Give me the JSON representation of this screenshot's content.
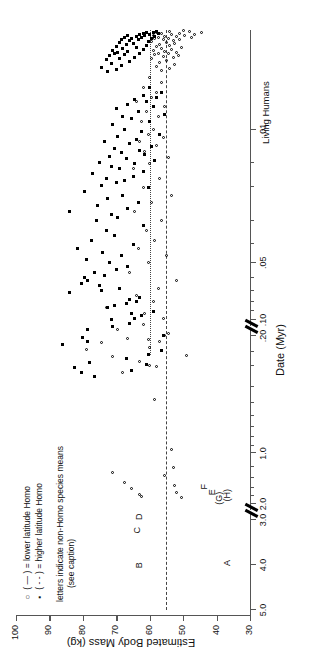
{
  "figure": {
    "x_axis_title": "Date (Myr)",
    "y_axis_title": "Estimated Body Mass (kg)",
    "living_humans_label": "Living Humans"
  },
  "legend": {
    "row1_symbol": "○",
    "row1_dash": "( — )",
    "row1_text": "= lower latitude Homo",
    "row2_symbol": "▪",
    "row2_dash": "( - - )",
    "row2_text": "= higher latitude Homo",
    "note_line1": "letters indicate non-Homo species means",
    "note_line2": "(see caption)"
  },
  "species_letters": [
    {
      "label": "A",
      "date": 4.0,
      "mass": 36.5
    },
    {
      "label": "B",
      "date": 4.05,
      "mass": 63.0
    },
    {
      "label": "C",
      "date": 2.95,
      "mass": 63.5
    },
    {
      "label": "D",
      "date": 2.45,
      "mass": 63.0
    },
    {
      "label": "E",
      "date": 1.75,
      "mass": 41.0
    },
    {
      "label": "F",
      "date": 1.62,
      "mass": 43.5
    },
    {
      "label": "(G)",
      "date": 1.9,
      "mass": 39.0
    },
    {
      "label": "(H)",
      "date": 1.82,
      "mass": 36.5
    }
  ],
  "mean_lines": [
    {
      "name": "lower-latitude-Homo-mean",
      "style": "dashed",
      "mass": 55.0,
      "span": "full"
    },
    {
      "name": "higher-latitude-Homo-mean",
      "style": "dotted",
      "mass": 60.0,
      "span": "recent"
    }
  ],
  "chart_data": {
    "type": "scatter",
    "title": "",
    "xlabel": "Date (Myr)",
    "ylabel": "Estimated Body Mass (kg)",
    "grid": false,
    "legend_position": "upper-left",
    "x_scale": "broken-reversed-log",
    "x_tick_labels": [
      "5.0",
      "4.0",
      "3.0",
      "2.0",
      "1.0",
      ".20",
      ".10",
      ".05",
      ".01",
      "Living Humans"
    ],
    "x_tick_values": [
      5.0,
      4.0,
      3.0,
      2.0,
      1.0,
      0.2,
      0.1,
      0.05,
      0.01,
      0.0
    ],
    "x_axis_breaks": [
      [
        3.0,
        2.0
      ],
      [
        0.2,
        0.1
      ]
    ],
    "y_tick_labels": [
      "30",
      "40",
      "50",
      "60",
      "70",
      "80",
      "90",
      "100"
    ],
    "y_tick_values": [
      30,
      40,
      50,
      60,
      70,
      80,
      90,
      100
    ],
    "ylim": [
      30,
      100
    ],
    "annotations": [
      {
        "text": "A",
        "x": 4.0,
        "y": 36.5
      },
      {
        "text": "B",
        "x": 4.05,
        "y": 63.0
      },
      {
        "text": "C",
        "x": 2.95,
        "y": 63.5
      },
      {
        "text": "D",
        "x": 2.45,
        "y": 63.0
      },
      {
        "text": "E",
        "x": 1.75,
        "y": 41.0
      },
      {
        "text": "F",
        "x": 1.62,
        "y": 43.5
      },
      {
        "text": "(G)",
        "x": 1.9,
        "y": 39.0
      },
      {
        "text": "(H)",
        "x": 1.82,
        "y": 36.5
      }
    ],
    "reference_lines": [
      {
        "label": "lower latitude Homo mean",
        "y": 55.0,
        "style": "dashed"
      },
      {
        "label": "higher latitude Homo mean",
        "y": 60.0,
        "style": "dotted"
      }
    ],
    "series": [
      {
        "name": "lower latitude Homo",
        "marker": "open-circle",
        "points": [
          [
            1.82,
            50.5
          ],
          [
            1.8,
            62.5
          ],
          [
            1.75,
            63.0
          ],
          [
            1.7,
            52.0
          ],
          [
            1.62,
            65.5
          ],
          [
            1.55,
            52.5
          ],
          [
            1.48,
            67.5
          ],
          [
            1.35,
            55.5
          ],
          [
            1.3,
            71.0
          ],
          [
            1.22,
            53.0
          ],
          [
            0.95,
            53.5
          ],
          [
            0.48,
            58.5
          ],
          [
            0.3,
            60.0
          ],
          [
            0.26,
            49.0
          ],
          [
            0.24,
            79.0
          ],
          [
            0.22,
            74.5
          ],
          [
            0.21,
            60.5
          ],
          [
            0.2,
            55.5
          ],
          [
            0.19,
            68.0
          ],
          [
            0.175,
            58.0
          ],
          [
            0.165,
            63.0
          ],
          [
            0.155,
            71.0
          ],
          [
            0.14,
            60.0
          ],
          [
            0.13,
            57.0
          ],
          [
            0.125,
            66.5
          ],
          [
            0.118,
            54.5
          ],
          [
            0.112,
            69.5
          ],
          [
            0.105,
            62.0
          ],
          [
            0.098,
            56.0
          ],
          [
            0.092,
            61.5
          ],
          [
            0.086,
            73.0
          ],
          [
            0.08,
            59.0
          ],
          [
            0.074,
            64.0
          ],
          [
            0.068,
            57.5
          ],
          [
            0.062,
            52.0
          ],
          [
            0.056,
            66.0
          ],
          [
            0.05,
            60.5
          ],
          [
            0.046,
            55.0
          ],
          [
            0.042,
            63.5
          ],
          [
            0.038,
            58.5
          ],
          [
            0.034,
            61.0
          ],
          [
            0.03,
            56.5
          ],
          [
            0.027,
            64.5
          ],
          [
            0.024,
            59.5
          ],
          [
            0.022,
            53.5
          ],
          [
            0.02,
            62.0
          ],
          [
            0.018,
            57.0
          ],
          [
            0.016,
            65.0
          ],
          [
            0.015,
            60.0
          ],
          [
            0.014,
            54.5
          ],
          [
            0.013,
            61.5
          ],
          [
            0.012,
            58.0
          ],
          [
            0.0115,
            63.0
          ],
          [
            0.011,
            56.0
          ],
          [
            0.0105,
            60.5
          ],
          [
            0.01,
            59.0
          ],
          [
            0.0095,
            62.5
          ],
          [
            0.009,
            57.5
          ],
          [
            0.0085,
            61.0
          ],
          [
            0.008,
            55.5
          ],
          [
            0.0075,
            64.0
          ],
          [
            0.007,
            59.5
          ],
          [
            0.0065,
            58.0
          ],
          [
            0.006,
            62.0
          ],
          [
            0.0055,
            56.5
          ],
          [
            0.005,
            60.0
          ]
        ]
      },
      {
        "name": "higher latitude Homo",
        "marker": "filled-square",
        "points": [
          [
            0.225,
            86.0
          ],
          [
            0.215,
            78.5
          ],
          [
            0.205,
            80.0
          ],
          [
            0.198,
            76.5
          ],
          [
            0.19,
            80.5
          ],
          [
            0.185,
            65.5
          ],
          [
            0.178,
            82.5
          ],
          [
            0.172,
            61.0
          ],
          [
            0.168,
            78.0
          ],
          [
            0.16,
            67.0
          ],
          [
            0.152,
            60.5
          ],
          [
            0.145,
            56.5
          ],
          [
            0.12,
            56.0
          ],
          [
            0.112,
            78.5
          ],
          [
            0.108,
            71.0
          ],
          [
            0.104,
            66.0
          ],
          [
            0.1,
            71.5
          ],
          [
            0.098,
            64.5
          ],
          [
            0.095,
            62.5
          ],
          [
            0.092,
            65.5
          ],
          [
            0.09,
            59.0
          ],
          [
            0.086,
            72.5
          ],
          [
            0.084,
            70.5
          ],
          [
            0.082,
            67.0
          ],
          [
            0.08,
            64.0
          ],
          [
            0.078,
            66.0
          ],
          [
            0.076,
            63.0
          ],
          [
            0.072,
            84.0
          ],
          [
            0.07,
            74.5
          ],
          [
            0.068,
            69.0
          ],
          [
            0.066,
            75.0
          ],
          [
            0.064,
            80.5
          ],
          [
            0.062,
            78.5
          ],
          [
            0.06,
            79.5
          ],
          [
            0.058,
            73.5
          ],
          [
            0.056,
            76.5
          ],
          [
            0.054,
            70.0
          ],
          [
            0.052,
            66.5
          ],
          [
            0.05,
            72.0
          ],
          [
            0.048,
            79.0
          ],
          [
            0.046,
            68.5
          ],
          [
            0.044,
            74.0
          ],
          [
            0.042,
            81.5
          ],
          [
            0.04,
            65.0
          ],
          [
            0.038,
            77.5
          ],
          [
            0.036,
            70.5
          ],
          [
            0.034,
            73.0
          ],
          [
            0.032,
            62.0
          ],
          [
            0.03,
            76.0
          ],
          [
            0.029,
            69.5
          ],
          [
            0.028,
            71.5
          ],
          [
            0.027,
            84.0
          ],
          [
            0.026,
            66.5
          ],
          [
            0.025,
            75.5
          ],
          [
            0.024,
            63.5
          ],
          [
            0.023,
            72.5
          ],
          [
            0.022,
            68.0
          ],
          [
            0.021,
            79.5
          ],
          [
            0.02,
            60.5
          ],
          [
            0.0195,
            74.5
          ],
          [
            0.019,
            70.0
          ],
          [
            0.0185,
            67.5
          ],
          [
            0.018,
            73.0
          ],
          [
            0.0175,
            65.0
          ],
          [
            0.017,
            77.0
          ],
          [
            0.0165,
            62.0
          ],
          [
            0.016,
            69.0
          ],
          [
            0.0155,
            71.5
          ],
          [
            0.015,
            64.5
          ],
          [
            0.0148,
            75.0
          ],
          [
            0.0145,
            58.5
          ],
          [
            0.0142,
            67.0
          ],
          [
            0.0138,
            72.0
          ],
          [
            0.0135,
            61.5
          ],
          [
            0.0132,
            68.5
          ],
          [
            0.0128,
            63.0
          ],
          [
            0.0125,
            70.5
          ],
          [
            0.0122,
            59.5
          ],
          [
            0.0118,
            66.0
          ],
          [
            0.0115,
            73.5
          ],
          [
            0.0112,
            64.0
          ],
          [
            0.0108,
            69.5
          ],
          [
            0.0105,
            57.0
          ],
          [
            0.0102,
            62.5
          ],
          [
            0.01,
            67.5
          ],
          [
            0.0098,
            71.0
          ],
          [
            0.0095,
            60.0
          ],
          [
            0.0092,
            65.5
          ],
          [
            0.009,
            68.0
          ],
          [
            0.0088,
            55.5
          ],
          [
            0.0085,
            63.5
          ],
          [
            0.0082,
            70.0
          ],
          [
            0.008,
            59.0
          ],
          [
            0.0078,
            66.5
          ],
          [
            0.0075,
            61.0
          ],
          [
            0.0072,
            64.5
          ],
          [
            0.007,
            58.0
          ],
          [
            0.0068,
            62.0
          ],
          [
            0.0065,
            56.5
          ],
          [
            0.006,
            60.0
          ]
        ]
      },
      {
        "name": "living humans open",
        "marker": "open-circle",
        "points": [
          [
            0.0042,
            56.5
          ],
          [
            0.004,
            54.0
          ],
          [
            0.0038,
            58.0
          ],
          [
            0.0036,
            52.5
          ],
          [
            0.0034,
            57.0
          ],
          [
            0.0032,
            55.0
          ],
          [
            0.003,
            59.5
          ],
          [
            0.0029,
            53.0
          ],
          [
            0.0028,
            56.0
          ],
          [
            0.0027,
            51.5
          ],
          [
            0.0026,
            58.5
          ],
          [
            0.0025,
            54.5
          ],
          [
            0.0024,
            57.5
          ],
          [
            0.0023,
            52.0
          ],
          [
            0.0022,
            55.5
          ],
          [
            0.0021,
            59.0
          ],
          [
            0.002,
            53.5
          ],
          [
            0.0019,
            56.5
          ],
          [
            0.0018,
            50.5
          ],
          [
            0.0017,
            58.0
          ],
          [
            0.0016,
            54.0
          ],
          [
            0.0015,
            57.0
          ],
          [
            0.0014,
            52.5
          ],
          [
            0.0013,
            55.0
          ],
          [
            0.0012,
            59.5
          ],
          [
            0.0011,
            53.0
          ],
          [
            0.001,
            56.0
          ],
          [
            0.00095,
            51.0
          ],
          [
            0.0009,
            58.5
          ],
          [
            0.00085,
            54.5
          ],
          [
            0.0008,
            47.5
          ],
          [
            0.00075,
            57.5
          ],
          [
            0.0007,
            52.0
          ],
          [
            0.00065,
            55.5
          ],
          [
            0.0006,
            49.5
          ],
          [
            0.00055,
            59.0
          ],
          [
            0.0005,
            53.5
          ],
          [
            0.00045,
            46.5
          ],
          [
            0.0004,
            56.5
          ],
          [
            0.00035,
            51.0
          ],
          [
            0.0003,
            58.0
          ],
          [
            0.00025,
            44.5
          ],
          [
            0.0002,
            54.0
          ],
          [
            0.00015,
            48.0
          ],
          [
            0.0001,
            50.0
          ]
        ]
      },
      {
        "name": "living humans filled",
        "marker": "filled-square",
        "points": [
          [
            0.0043,
            72.5
          ],
          [
            0.0041,
            70.0
          ],
          [
            0.0039,
            74.5
          ],
          [
            0.0037,
            68.5
          ],
          [
            0.0035,
            71.5
          ],
          [
            0.0033,
            66.0
          ],
          [
            0.0031,
            73.0
          ],
          [
            0.003,
            69.0
          ],
          [
            0.0029,
            64.5
          ],
          [
            0.0027,
            72.0
          ],
          [
            0.0026,
            67.5
          ],
          [
            0.0025,
            70.5
          ],
          [
            0.0024,
            63.0
          ],
          [
            0.0023,
            69.5
          ],
          [
            0.0022,
            66.5
          ],
          [
            0.0021,
            71.0
          ],
          [
            0.002,
            62.0
          ],
          [
            0.0019,
            68.0
          ],
          [
            0.0018,
            64.0
          ],
          [
            0.0017,
            70.0
          ],
          [
            0.0016,
            61.0
          ],
          [
            0.0015,
            67.0
          ],
          [
            0.0014,
            65.0
          ],
          [
            0.0013,
            69.0
          ],
          [
            0.0012,
            60.5
          ],
          [
            0.0011,
            66.0
          ],
          [
            0.001,
            63.5
          ],
          [
            0.00095,
            68.5
          ],
          [
            0.0009,
            59.5
          ],
          [
            0.00085,
            65.5
          ],
          [
            0.0008,
            62.5
          ],
          [
            0.00075,
            67.5
          ],
          [
            0.0007,
            58.5
          ],
          [
            0.00065,
            64.0
          ],
          [
            0.0006,
            61.5
          ],
          [
            0.00055,
            66.5
          ],
          [
            0.0005,
            60.0
          ],
          [
            0.00045,
            63.0
          ],
          [
            0.0004,
            57.5
          ],
          [
            0.00035,
            62.0
          ],
          [
            0.0003,
            59.0
          ],
          [
            0.00025,
            61.0
          ],
          [
            0.0002,
            58.0
          ]
        ]
      }
    ]
  }
}
